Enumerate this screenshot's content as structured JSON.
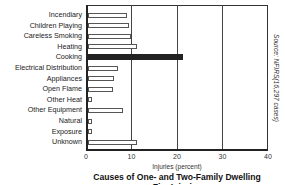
{
  "chart_data": {
    "type": "bar",
    "orientation": "horizontal",
    "title": "Causes of One- and Two-Family Dwelling",
    "title_line2": "Fire Injuries",
    "xlabel": "Injuries (percent)",
    "ylabel": "",
    "source": "Source: NFIRS(16,297 cases)",
    "xlim": [
      0,
      40
    ],
    "xticks": [
      "0",
      "10",
      "20",
      "30",
      "40"
    ],
    "grid": "vertical at 10, 20, 30",
    "categories": [
      "Incendiary",
      "Children Playing",
      "Careless Smoking",
      "Heating",
      "Cooking",
      "Electrical Distribution",
      "Appliances",
      "Open Flame",
      "Other Heat",
      "Other Equipment",
      "Natural",
      "Exposure",
      "Unknown"
    ],
    "values": [
      8.7,
      9.3,
      9.6,
      11.0,
      21.2,
      6.8,
      6.0,
      5.7,
      1.0,
      8.0,
      0.7,
      0.6,
      11.0
    ],
    "highlighted": "Cooking",
    "colors": {
      "bar_fill": "#ffffff",
      "bar_outline": "#555555",
      "highlight": "#222222"
    }
  }
}
